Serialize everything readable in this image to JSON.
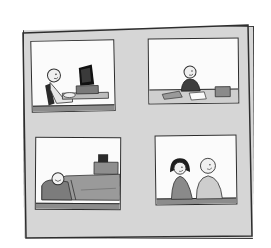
{
  "illustration": {
    "description": "Hand-drawn cartoon board with four framed scenes",
    "board_color": "#d6d6d6",
    "panel_color": "#fbfbfb",
    "line_color": "#2b2b2b",
    "panels": [
      {
        "id": "top-left",
        "scene": "Person sitting in chair typing at a computer desk"
      },
      {
        "id": "top-right",
        "scene": "Person sitting at a table with papers and a book"
      },
      {
        "id": "bottom-left",
        "scene": "Person sleeping in bed with a clock on the nightstand"
      },
      {
        "id": "bottom-right",
        "scene": "Two people, a girl and a boy, standing together"
      }
    ]
  }
}
